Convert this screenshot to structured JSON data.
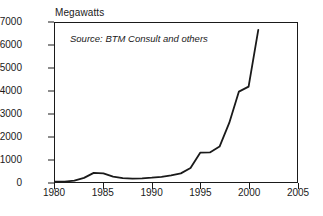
{
  "chart_data": {
    "type": "line",
    "title": "",
    "ylabel": "Megawatts",
    "xlabel": "",
    "annotation": "Source: BTM Consult and others",
    "grid": false,
    "legend": false,
    "xlim": [
      1980,
      2005
    ],
    "ylim": [
      0,
      7000
    ],
    "xticks": [
      "1980",
      "1985",
      "1990",
      "1995",
      "2000",
      "2005"
    ],
    "xtick_values": [
      1980,
      1985,
      1990,
      1995,
      2000,
      2005
    ],
    "yticks": [
      "0",
      "1000",
      "2000",
      "3000",
      "4000",
      "5000",
      "6000",
      "7000"
    ],
    "ytick_values": [
      0,
      1000,
      2000,
      3000,
      4000,
      5000,
      6000,
      7000
    ],
    "line_color": "#1a1a1a",
    "series": [
      {
        "name": "Annual wind capacity additions",
        "x": [
          1980,
          1981,
          1982,
          1983,
          1984,
          1985,
          1986,
          1987,
          1988,
          1989,
          1990,
          1991,
          1992,
          1993,
          1994,
          1995,
          1996,
          1997,
          1998,
          1999,
          2000,
          2001
        ],
        "values": [
          10,
          20,
          60,
          180,
          400,
          380,
          240,
          170,
          150,
          160,
          190,
          230,
          290,
          380,
          620,
          1290,
          1300,
          1560,
          2600,
          3980,
          4200,
          6700
        ]
      }
    ]
  },
  "colors": {
    "ink": "#1a1a1a",
    "background": "#ffffff"
  }
}
